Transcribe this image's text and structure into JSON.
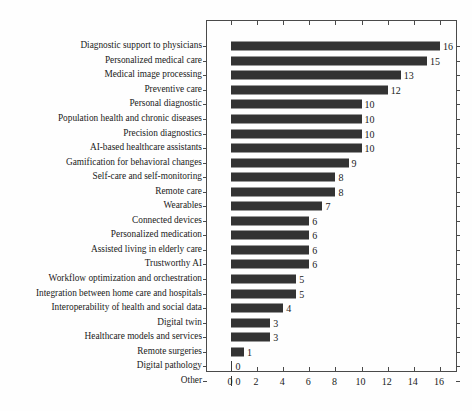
{
  "chart_data": {
    "type": "bar",
    "orientation": "horizontal",
    "title": "",
    "xlabel": "",
    "ylabel": "",
    "xlim": [
      0,
      17
    ],
    "xticks": [
      0,
      2,
      4,
      6,
      8,
      10,
      12,
      14,
      16
    ],
    "grid": false,
    "legend": null,
    "bar_color": "#333333",
    "categories": [
      "Diagnostic support to physicians",
      "Personalized medical care",
      "Medical image processing",
      "Preventive care",
      "Personal diagnostic",
      "Population health and chronic diseases",
      "Precision diagnostics",
      "AI-based healthcare assistants",
      "Gamification for behavioral changes",
      "Self-care and self-monitoring",
      "Remote care",
      "Wearables",
      "Connected devices",
      "Personalized medication",
      "Assisted living in elderly care",
      "Trustworthy AI",
      "Workflow optimization and orchestration",
      "Integration between home care and hospitals",
      "Interoperability of health and social data",
      "Digital twin",
      "Healthcare models and services",
      "Remote surgeries",
      "Digital pathology",
      "Other"
    ],
    "values": [
      16,
      15,
      13,
      12,
      10,
      10,
      10,
      10,
      9,
      8,
      8,
      7,
      6,
      6,
      6,
      6,
      5,
      5,
      4,
      3,
      3,
      1,
      0,
      0
    ],
    "value_labels": [
      "16",
      "15",
      "13",
      "12",
      "10",
      "10",
      "10",
      "10",
      "9",
      "8",
      "8",
      "7",
      "6",
      "6",
      "6",
      "6",
      "5",
      "5",
      "4",
      "3",
      "3",
      "1",
      "0",
      "0"
    ]
  }
}
